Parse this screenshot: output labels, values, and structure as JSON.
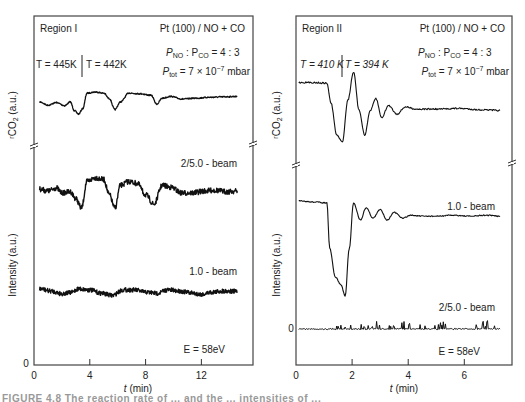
{
  "chart_data": [
    {
      "type": "line",
      "panel": "left",
      "title": "Region I",
      "system": "Pt (100) / NO + CO",
      "ratio_label": "P_NO : P_CO = 4 : 3",
      "ptot_label": "P_tot = 7 × 10^-7 mbar",
      "temperatures": [
        "T = 445K",
        "T = 442K"
      ],
      "temperature_switch_min": 3.4,
      "energy_label": "E = 58eV",
      "xlabel": "t (min)",
      "ylabel_top": "rCO2 (a.u.)",
      "ylabel_bottom": "Intensity (a.u.)",
      "xlim": [
        0,
        15.7
      ],
      "xticks": [
        0,
        4,
        8,
        12
      ],
      "y_zero_label": "0",
      "axis_break": true,
      "series": [
        {
          "name": "rCO2",
          "noise": 0.6,
          "x": [
            0.4,
            1.0,
            1.6,
            2.2,
            2.6,
            2.9,
            3.2,
            3.5,
            3.8,
            4.4,
            5.0,
            5.4,
            5.8,
            6.2,
            6.8,
            7.6,
            8.4,
            8.8,
            9.2,
            9.8,
            10.6,
            11.6,
            12.6,
            13.6,
            14.6
          ],
          "y": [
            0.55,
            0.4,
            0.52,
            0.38,
            0.55,
            0.15,
            0.0,
            0.25,
            0.95,
            1.0,
            0.95,
            0.7,
            0.2,
            0.55,
            0.95,
            0.92,
            0.85,
            0.45,
            0.72,
            0.8,
            0.68,
            0.72,
            0.76,
            0.78,
            0.8
          ]
        },
        {
          "name": "2/5.0 - beam",
          "noise": 2.6,
          "x": [
            0.4,
            1.0,
            1.6,
            2.0,
            2.6,
            3.0,
            3.4,
            3.8,
            4.4,
            5.0,
            5.4,
            5.8,
            6.2,
            6.8,
            7.4,
            8.0,
            8.6,
            9.2,
            9.8,
            10.6,
            11.4,
            12.2,
            13.0,
            13.8,
            14.6
          ],
          "y": [
            0.55,
            0.5,
            0.58,
            0.45,
            0.48,
            0.3,
            0.05,
            0.75,
            0.85,
            0.8,
            0.4,
            0.05,
            0.65,
            0.75,
            0.7,
            0.4,
            0.15,
            0.65,
            0.6,
            0.45,
            0.45,
            0.5,
            0.52,
            0.48,
            0.5
          ]
        },
        {
          "name": "1.0 - beam",
          "noise": 2.2,
          "x": [
            0.4,
            1.2,
            2.0,
            2.6,
            3.2,
            4.0,
            4.8,
            5.6,
            6.4,
            7.2,
            8.0,
            8.8,
            9.6,
            10.4,
            11.2,
            12.0,
            12.8,
            13.6,
            14.6
          ],
          "y": [
            0.6,
            0.5,
            0.38,
            0.42,
            0.6,
            0.55,
            0.4,
            0.3,
            0.55,
            0.55,
            0.45,
            0.4,
            0.55,
            0.5,
            0.42,
            0.35,
            0.45,
            0.5,
            0.48
          ]
        }
      ]
    },
    {
      "type": "line",
      "panel": "right",
      "title": "Region II",
      "system": "Pt (100) / NO + CO",
      "ratio_label": "P_NO : P_CO = 4 : 3",
      "ptot_label": "P_tot = 7 × 10^-7 mbar",
      "temperatures": [
        "T = 410 K",
        "T = 394 K"
      ],
      "temperature_switch_min": 1.0,
      "energy_label": "E = 58eV",
      "xlabel": "t (min)",
      "ylabel_top": "rCO2 (a.u.)",
      "ylabel_bottom": "Intensity (a.u.)",
      "xlim": [
        0,
        7.7
      ],
      "xticks": [
        0,
        2,
        4,
        6
      ],
      "y_zero_label": "0",
      "axis_break": true,
      "series": [
        {
          "name": "rCO2",
          "noise": 0.7,
          "x": [
            0.1,
            0.6,
            1.1,
            1.25,
            1.45,
            1.65,
            1.85,
            2.05,
            2.25,
            2.45,
            2.65,
            2.85,
            3.05,
            3.3,
            3.6,
            3.9,
            4.3,
            5.0,
            5.8,
            6.6,
            7.3
          ],
          "y": [
            0.85,
            0.85,
            0.84,
            0.55,
            0.1,
            0.0,
            0.6,
            1.0,
            0.45,
            0.1,
            0.45,
            0.62,
            0.35,
            0.52,
            0.4,
            0.5,
            0.47,
            0.47,
            0.48,
            0.46,
            0.45
          ],
          "scale_px": 70
        },
        {
          "name": "1.0 - beam",
          "noise": 0.5,
          "x": [
            0.1,
            0.6,
            1.1,
            1.2,
            1.4,
            1.6,
            1.75,
            1.9,
            2.05,
            2.3,
            2.5,
            2.75,
            3.0,
            3.25,
            3.5,
            3.8,
            4.1,
            4.5,
            5.0,
            5.6,
            6.2,
            6.8,
            7.3
          ],
          "y": [
            1.0,
            0.99,
            0.98,
            0.5,
            0.2,
            0.12,
            0.0,
            0.5,
            0.98,
            0.8,
            0.93,
            0.82,
            0.91,
            0.8,
            0.88,
            0.82,
            0.85,
            0.84,
            0.84,
            0.85,
            0.84,
            0.85,
            0.84
          ],
          "scale_px": 95
        },
        {
          "name": "2/5.0 - beam",
          "noise": 0.0,
          "spiky": true,
          "x": [
            0.1,
            7.3
          ],
          "y": [
            0.0,
            0.0
          ],
          "scale_px": 10
        }
      ]
    }
  ],
  "caption": "FIGURE 4.8   The reaction rate of ... and the ... intensities of ..."
}
